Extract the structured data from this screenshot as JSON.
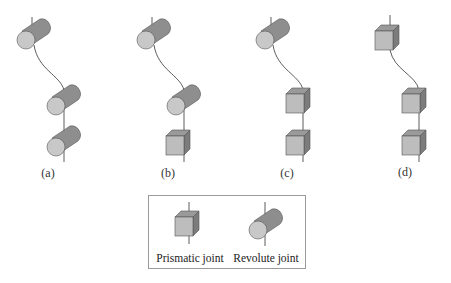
{
  "figure": {
    "panels": [
      {
        "id": "a",
        "caption": "(a)",
        "joints": [
          "revolute",
          "revolute",
          "revolute"
        ]
      },
      {
        "id": "b",
        "caption": "(b)",
        "joints": [
          "revolute",
          "revolute",
          "prismatic"
        ]
      },
      {
        "id": "c",
        "caption": "(c)",
        "joints": [
          "revolute",
          "prismatic",
          "prismatic"
        ]
      },
      {
        "id": "d",
        "caption": "(d)",
        "joints": [
          "prismatic",
          "prismatic",
          "prismatic"
        ]
      }
    ],
    "legend": {
      "prismatic_label": "Prismatic joint",
      "revolute_label": "Revolute joint"
    },
    "colors": {
      "cylinder_body": "#8e8e8e",
      "cylinder_face": "#c8c8c8",
      "cube_front": "#bdbdbd",
      "cube_top": "#9a9a9a",
      "cube_side": "#7c7c7c",
      "line": "#333333",
      "legend_border": "#9a9a9a"
    }
  }
}
